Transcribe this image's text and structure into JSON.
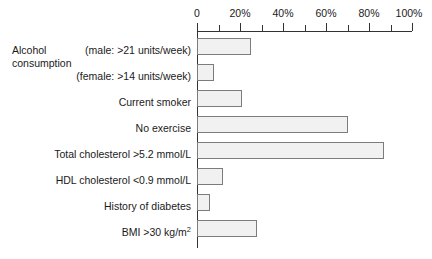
{
  "chart_data": {
    "type": "bar",
    "orientation": "horizontal",
    "title": "",
    "xlabel": "",
    "ylabel": "",
    "xlim": [
      0,
      100
    ],
    "xticks": [
      0,
      20,
      40,
      60,
      80,
      100
    ],
    "xticklabels": [
      "0",
      "20%",
      "40%",
      "60%",
      "80%",
      "100%"
    ],
    "minor_tick_step": 10,
    "grid": false,
    "legend": false,
    "bar_fill_color": "#f1f1f1",
    "bar_border_color": "#7c7c7c",
    "axis_color": "#333333",
    "categories": [
      "(male: >21 units/week)",
      "(female: >14 units/week)",
      "Current smoker",
      "No exercise",
      "Total cholesterol >5.2 mmol/L",
      "HDL cholesterol <0.9 mmol/L",
      "History of diabetes",
      "BMI >30 kg/m"
    ],
    "values": [
      25,
      8,
      21,
      70,
      87,
      12,
      6,
      28
    ],
    "group_labels": [
      {
        "text_line1": "Alcohol",
        "text_line2": "consumption",
        "spans_categories": [
          "(male: >21 units/week)",
          "(female: >14 units/week)"
        ]
      }
    ],
    "annotations": {
      "bmi_superscript": "2"
    }
  },
  "axis": {
    "ticks": [
      {
        "label": "0",
        "value": 0,
        "major": true
      },
      {
        "label": "",
        "value": 10,
        "major": false
      },
      {
        "label": "20%",
        "value": 20,
        "major": true
      },
      {
        "label": "",
        "value": 30,
        "major": false
      },
      {
        "label": "40%",
        "value": 40,
        "major": true
      },
      {
        "label": "",
        "value": 50,
        "major": false
      },
      {
        "label": "60%",
        "value": 60,
        "major": true
      },
      {
        "label": "",
        "value": 70,
        "major": false
      },
      {
        "label": "80%",
        "value": 80,
        "major": true
      },
      {
        "label": "",
        "value": 90,
        "major": false
      },
      {
        "label": "100%",
        "value": 100,
        "major": true
      }
    ]
  },
  "group": {
    "alcohol_line1": "Alcohol",
    "alcohol_line2": "consumption"
  },
  "labels": {
    "cat0": "(male: >21 units/week)",
    "cat1": "(female: >14 units/week)",
    "cat2": "Current smoker",
    "cat3": "No exercise",
    "cat4": "Total cholesterol >5.2 mmol/L",
    "cat5": "HDL cholesterol <0.9 mmol/L",
    "cat6": "History of diabetes",
    "cat7_main": "BMI >30 kg/m",
    "cat7_sup": "2"
  }
}
